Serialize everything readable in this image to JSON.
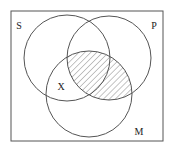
{
  "diagram": {
    "type": "venn-3-set",
    "colors": {
      "background": "#ffffff",
      "stroke": "#555555",
      "hatch": "#8a8a8a",
      "label": "#222222"
    },
    "universe": {
      "x": 11,
      "y": 11,
      "width": 152,
      "height": 130
    },
    "sets": [
      {
        "id": "S",
        "label": "S",
        "cx": 67,
        "cy": 58,
        "r": 43,
        "label_x": 19,
        "label_y": 29
      },
      {
        "id": "P",
        "label": "P",
        "cx": 109,
        "cy": 58,
        "r": 42,
        "label_x": 154,
        "label_y": 29
      },
      {
        "id": "M",
        "label": "M",
        "cx": 89,
        "cy": 94,
        "r": 43,
        "label_x": 139,
        "label_y": 135
      }
    ],
    "shaded_region": {
      "description": "M ∩ P (hatched)",
      "sets": [
        "M",
        "P"
      ],
      "pattern": "diagonal-hatch"
    },
    "marks": [
      {
        "label": "X",
        "region": "S ∩ M, not P",
        "x": 61,
        "y": 90
      }
    ]
  }
}
